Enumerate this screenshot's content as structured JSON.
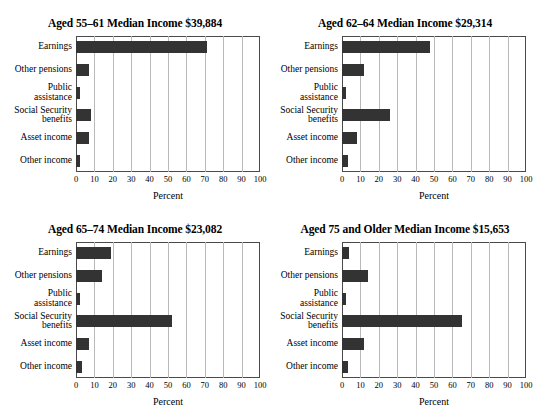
{
  "page": {
    "faint_header_line": "",
    "axis_label": "Percent",
    "tick_labels": [
      "0",
      "10",
      "20",
      "30",
      "40",
      "50",
      "60",
      "70",
      "80",
      "90",
      "100"
    ],
    "categories": [
      "Earnings",
      "Other pensions",
      "Public\nassistance",
      "Social Security\nbenefits",
      "Asset income",
      "Other income"
    ]
  },
  "chart_data": [
    {
      "type": "bar",
      "title": "Aged 55–61 Median Income $39,884",
      "orientation": "horizontal",
      "categories": [
        "Earnings",
        "Other pensions",
        "Public assistance",
        "Social Security benefits",
        "Asset income",
        "Other income"
      ],
      "values": [
        71,
        7,
        2,
        8,
        7,
        2
      ],
      "xlabel": "Percent",
      "ylabel": "",
      "xlim": [
        0,
        100
      ],
      "xticks": [
        0,
        10,
        20,
        30,
        40,
        50,
        60,
        70,
        80,
        90,
        100
      ],
      "grid": "vertical",
      "legend": "none",
      "bar_color": "#333333"
    },
    {
      "type": "bar",
      "title": "Aged 62–64 Median Income $29,314",
      "orientation": "horizontal",
      "categories": [
        "Earnings",
        "Other pensions",
        "Public assistance",
        "Social Security benefits",
        "Asset income",
        "Other income"
      ],
      "values": [
        48,
        12,
        2,
        26,
        8,
        3
      ],
      "xlabel": "Percent",
      "ylabel": "",
      "xlim": [
        0,
        100
      ],
      "xticks": [
        0,
        10,
        20,
        30,
        40,
        50,
        60,
        70,
        80,
        90,
        100
      ],
      "grid": "vertical",
      "legend": "none",
      "bar_color": "#333333"
    },
    {
      "type": "bar",
      "title": "Aged 65–74 Median Income $23,082",
      "orientation": "horizontal",
      "categories": [
        "Earnings",
        "Other pensions",
        "Public assistance",
        "Social Security benefits",
        "Asset income",
        "Other income"
      ],
      "values": [
        19,
        14,
        2,
        52,
        7,
        3
      ],
      "xlabel": "Percent",
      "ylabel": "",
      "xlim": [
        0,
        100
      ],
      "xticks": [
        0,
        10,
        20,
        30,
        40,
        50,
        60,
        70,
        80,
        90,
        100
      ],
      "grid": "vertical",
      "legend": "none",
      "bar_color": "#333333"
    },
    {
      "type": "bar",
      "title": "Aged 75 and Older Median Income $15,653",
      "orientation": "horizontal",
      "categories": [
        "Earnings",
        "Other pensions",
        "Public assistance",
        "Social Security benefits",
        "Asset income",
        "Other income"
      ],
      "values": [
        4,
        14,
        2,
        65,
        12,
        3
      ],
      "xlabel": "Percent",
      "ylabel": "",
      "xlim": [
        0,
        100
      ],
      "xticks": [
        0,
        10,
        20,
        30,
        40,
        50,
        60,
        70,
        80,
        90,
        100
      ],
      "grid": "vertical",
      "legend": "none",
      "bar_color": "#333333"
    }
  ]
}
